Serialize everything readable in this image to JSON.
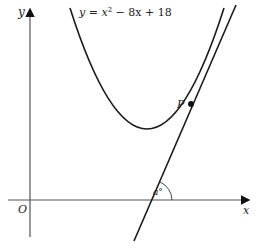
{
  "diagram": {
    "curve_equation": {
      "prefix": "y = x",
      "exponent": "2",
      "suffix": " − 8x + 18"
    },
    "labels": {
      "y_axis": "y",
      "x_axis": "x",
      "origin": "O",
      "point": "P",
      "angle": "a°"
    },
    "colors": {
      "stroke": "#1a1a1a",
      "axis": "#555555",
      "background": "#ffffff"
    }
  }
}
